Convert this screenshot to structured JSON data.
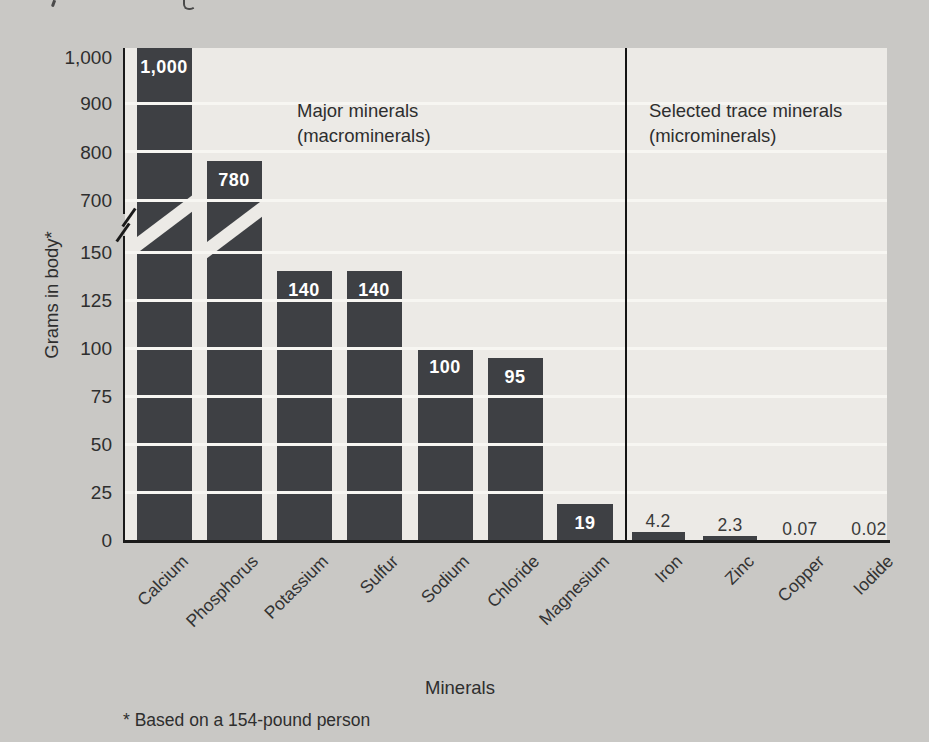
{
  "figure": {
    "ylabel": "Grams in body*",
    "xlabel": "Minerals",
    "footnote": "* Based on a 154-pound person",
    "group_headers": {
      "major": {
        "line1": "Major minerals",
        "line2": "(macrominerals)"
      },
      "trace": {
        "line1": "Selected trace minerals",
        "line2": "(microminerals)"
      }
    }
  },
  "chart_data": {
    "type": "bar",
    "title": "",
    "ylabel": "Grams in body*",
    "xlabel": "Minerals",
    "footnote": "* Based on a 154-pound person",
    "grid": true,
    "bar_color": "#3e4044",
    "plot_bg_color": "#eceae6",
    "page_bg_color": "#c9c8c5",
    "axis_break": {
      "between": [
        150,
        700
      ],
      "break_icon": "double-slash"
    },
    "y_axis": {
      "lower_range": [
        0,
        150
      ],
      "upper_range": [
        700,
        1000
      ],
      "lower_ticks": [
        0,
        25,
        50,
        75,
        100,
        125,
        150
      ],
      "upper_ticks": [
        700,
        800,
        900,
        1000
      ],
      "lower_tick_labels": [
        "0",
        "25",
        "50",
        "75",
        "100",
        "125",
        "150"
      ],
      "upper_tick_labels": [
        "700",
        "800",
        "900",
        "1,000"
      ]
    },
    "categories": [
      "Calcium",
      "Phosphorus",
      "Potassium",
      "Sulfur",
      "Sodium",
      "Chloride",
      "Magnesium",
      "Iron",
      "Zinc",
      "Copper",
      "Iodide"
    ],
    "values": [
      1000,
      780,
      140,
      140,
      100,
      95,
      19,
      4.2,
      2.3,
      0.07,
      0.02
    ],
    "value_labels": [
      "1,000",
      "780",
      "140",
      "140",
      "100",
      "95",
      "19",
      "4.2",
      "2.3",
      "0.07",
      "0.02"
    ],
    "group_of": [
      "major",
      "major",
      "major",
      "major",
      "major",
      "major",
      "major",
      "trace",
      "trace",
      "trace",
      "trace"
    ],
    "groups": [
      {
        "id": "major",
        "header_line1": "Major minerals",
        "header_line2": "(macrominerals)",
        "categories": [
          "Calcium",
          "Phosphorus",
          "Potassium",
          "Sulfur",
          "Sodium",
          "Chloride",
          "Magnesium"
        ],
        "values": [
          1000,
          780,
          140,
          140,
          100,
          95,
          19
        ]
      },
      {
        "id": "trace",
        "header_line1": "Selected trace minerals",
        "header_line2": "(microminerals)",
        "categories": [
          "Iron",
          "Zinc",
          "Copper",
          "Iodide"
        ],
        "values": [
          4.2,
          2.3,
          0.07,
          0.02
        ]
      }
    ],
    "legend": "none"
  }
}
